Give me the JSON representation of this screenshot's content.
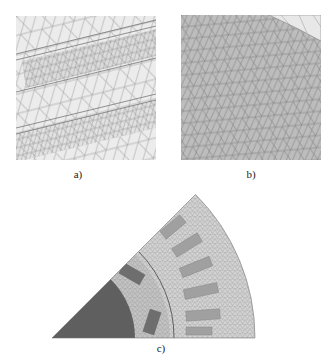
{
  "figure": {
    "panels": [
      {
        "id": "a",
        "label": "a)",
        "description": "Zoomed triangular finite-element mesh showing two rectangular magnet regions (finer mesh) and surrounding coarser mesh"
      },
      {
        "id": "b",
        "label": "b)",
        "description": "Zoomed regular triangular mesh in a curved region (gray fill)"
      },
      {
        "id": "c",
        "label": "c)",
        "description": "45-degree sector of an electrical machine cross-section with triangular FE mesh: dark rotor core, rotor magnets, air gap, stator slots"
      }
    ],
    "colors": {
      "background": "#ffffff",
      "mesh_line": "#8a8a8a",
      "panel_a_fill": "#ececec",
      "panel_b_fill": "#bdbdbd",
      "rotor_core": "#5f5f5f",
      "magnet": "#6e6e6e",
      "stator_mesh": "#cfcfcf",
      "slot": "#9a9a9a"
    }
  }
}
